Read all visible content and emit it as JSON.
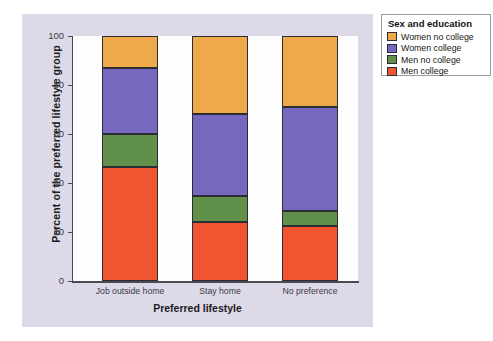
{
  "chart_data": {
    "type": "bar",
    "subtype": "stacked-percent",
    "title": "",
    "xlabel": "Preferred lifestyle",
    "ylabel": "Percent of the preferred lifestyle group",
    "categories": [
      "Job outside home",
      "Stay home",
      "No preference"
    ],
    "ylim": [
      0,
      100
    ],
    "yticks": [
      0,
      20,
      40,
      60,
      80,
      100
    ],
    "ytick_labels": [
      "0",
      "20",
      "40",
      "60",
      "80",
      "100"
    ],
    "grid": false,
    "legend_position": "right-outside",
    "legend_title": "Sex and education",
    "series": [
      {
        "name": "Men college",
        "color": "#ee5530",
        "values": [
          46.5,
          24.0,
          22.5
        ]
      },
      {
        "name": "Men no college",
        "color": "#60904a",
        "values": [
          13.7,
          10.5,
          6.0
        ]
      },
      {
        "name": "Women college",
        "color": "#7568be",
        "values": [
          26.8,
          33.5,
          42.5
        ]
      },
      {
        "name": "Women no college",
        "color": "#eea94a",
        "values": [
          13.0,
          32.0,
          29.0
        ]
      }
    ],
    "stack_order_bottom_to_top": [
      "Men college",
      "Men no college",
      "Women college",
      "Women no college"
    ],
    "cumulative_boundaries": [
      [
        46.5,
        60.2,
        87.0,
        100
      ],
      [
        24.0,
        34.5,
        68.0,
        100
      ],
      [
        22.5,
        28.5,
        71.0,
        100
      ]
    ]
  },
  "legend": {
    "title": "Sex and education",
    "items": [
      {
        "label": "Women no college",
        "color": "#eea94a"
      },
      {
        "label": "Women college",
        "color": "#7568be"
      },
      {
        "label": "Men no college",
        "color": "#60904a"
      },
      {
        "label": "Men college",
        "color": "#ee5530"
      }
    ]
  }
}
